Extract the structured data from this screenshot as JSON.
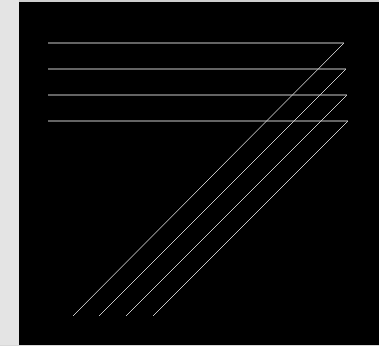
{
  "colors": {
    "background": "#000000",
    "line": "#c8c8c8",
    "side_strip": "#e4e4e4",
    "page": "#ffffff"
  },
  "figure": {
    "lines": [
      {
        "start": [
          48,
          43
        ],
        "corner": [
          344,
          43
        ],
        "end": [
          73,
          316
        ]
      },
      {
        "start": [
          48,
          69
        ],
        "corner": [
          346,
          69
        ],
        "end": [
          99,
          316
        ]
      },
      {
        "start": [
          48,
          95
        ],
        "corner": [
          347,
          95
        ],
        "end": [
          126,
          316
        ]
      },
      {
        "start": [
          48,
          121
        ],
        "corner": [
          348,
          121
        ],
        "end": [
          153,
          316
        ]
      }
    ]
  }
}
